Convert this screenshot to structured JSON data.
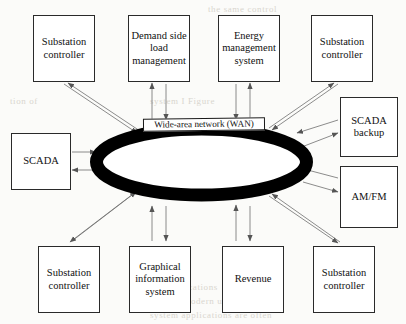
{
  "diagram": {
    "center": {
      "name": "wide-area-network",
      "label": "Wide-area network (WAN)",
      "shape": "ellipse-ring",
      "fill": "#000000"
    },
    "colors": {
      "box_border": "#2a2a2a",
      "box_fill": "#ffffff",
      "arrow": "#6f6f6f",
      "ring": "#000000",
      "text": "#111111",
      "page": "#fbfbf9"
    },
    "nodes": [
      {
        "id": "substation-controller-top-left",
        "label": "Substation\ncontroller",
        "x": 33,
        "y": 15,
        "w": 62,
        "h": 67
      },
      {
        "id": "demand-side-load-management",
        "label": "Demand side\nload\nmanagement",
        "x": 128,
        "y": 15,
        "w": 62,
        "h": 67
      },
      {
        "id": "energy-management-system",
        "label": "Energy\nmanagement\nsystem",
        "x": 218,
        "y": 15,
        "w": 62,
        "h": 67
      },
      {
        "id": "substation-controller-top-right",
        "label": "Substation\ncontroller",
        "x": 311,
        "y": 15,
        "w": 62,
        "h": 67
      },
      {
        "id": "scada",
        "label": "SCADA",
        "x": 11,
        "y": 133,
        "w": 60,
        "h": 57
      },
      {
        "id": "scada-backup",
        "label": "SCADA\nbackup",
        "x": 340,
        "y": 97,
        "w": 58,
        "h": 60
      },
      {
        "id": "am-fm",
        "label": "AM/FM",
        "x": 340,
        "y": 166,
        "w": 58,
        "h": 62
      },
      {
        "id": "substation-controller-bottom-left",
        "label": "Substation\ncontroller",
        "x": 38,
        "y": 246,
        "w": 62,
        "h": 67
      },
      {
        "id": "graphical-information-system",
        "label": "Graphical\ninformation\nsystem",
        "x": 129,
        "y": 246,
        "w": 62,
        "h": 67
      },
      {
        "id": "revenue",
        "label": "Revenue",
        "x": 222,
        "y": 246,
        "w": 62,
        "h": 67
      },
      {
        "id": "substation-controller-bottom-right",
        "label": "Substation\ncontroller",
        "x": 313,
        "y": 246,
        "w": 62,
        "h": 67
      }
    ],
    "connections": [
      {
        "from": "substation-controller-top-left",
        "to": "wide-area-network",
        "type": "bidirectional"
      },
      {
        "from": "demand-side-load-management",
        "to": "wide-area-network",
        "type": "bidirectional"
      },
      {
        "from": "energy-management-system",
        "to": "wide-area-network",
        "type": "bidirectional"
      },
      {
        "from": "substation-controller-top-right",
        "to": "wide-area-network",
        "type": "bidirectional"
      },
      {
        "from": "scada",
        "to": "wide-area-network",
        "type": "bidirectional"
      },
      {
        "from": "scada-backup",
        "to": "wide-area-network",
        "type": "bidirectional"
      },
      {
        "from": "am-fm",
        "to": "wide-area-network",
        "type": "bidirectional"
      },
      {
        "from": "substation-controller-bottom-left",
        "to": "wide-area-network",
        "type": "bidirectional"
      },
      {
        "from": "graphical-information-system",
        "to": "wide-area-network",
        "type": "bidirectional"
      },
      {
        "from": "revenue",
        "to": "wide-area-network",
        "type": "bidirectional"
      },
      {
        "from": "substation-controller-bottom-right",
        "to": "wide-area-network",
        "type": "bidirectional"
      }
    ],
    "background_bleed": [
      {
        "text": "the same control",
        "x": 208,
        "y": 4
      },
      {
        "text": "tion of",
        "x": 10,
        "y": 96
      },
      {
        "text": "system  I  Figure",
        "x": 150,
        "y": 96
      },
      {
        "text": "data",
        "x": 236,
        "y": 190
      },
      {
        "text": "communications",
        "x": 150,
        "y": 282
      },
      {
        "text": "and  the  modern  utility  requires",
        "x": 150,
        "y": 296
      },
      {
        "text": "system   applications   are   often",
        "x": 150,
        "y": 310
      }
    ]
  }
}
